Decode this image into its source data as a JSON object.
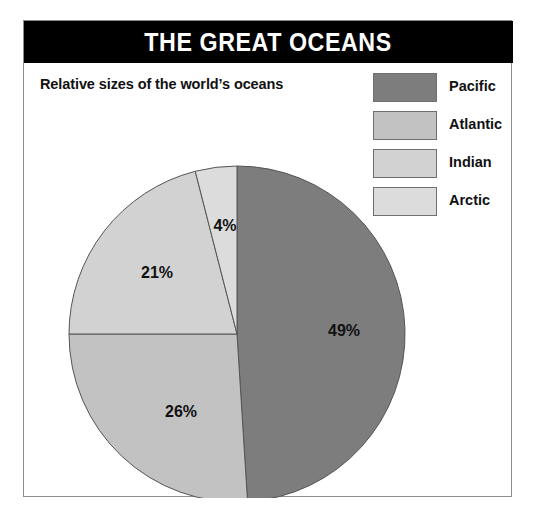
{
  "panel": {
    "title": "THE GREAT OCEANS",
    "subtitle": "Relative sizes of the world’s oceans",
    "border_color": "#8d8d8d",
    "title_bar_color": "#000000",
    "title_text_color": "#ffffff",
    "background_color": "#ffffff"
  },
  "legend": {
    "position": "top-right",
    "items": [
      {
        "label": "Pacific",
        "color": "#7d7d7d"
      },
      {
        "label": "Atlantic",
        "color": "#c2c2c2"
      },
      {
        "label": "Indian",
        "color": "#d2d2d2"
      },
      {
        "label": "Arctic",
        "color": "#dcdcdc"
      }
    ]
  },
  "chart_data": {
    "type": "pie",
    "title": "THE GREAT OCEANS",
    "subtitle": "Relative sizes of the world’s oceans",
    "xlabel": "",
    "ylabel": "",
    "unit": "percent",
    "start_angle_deg": 0,
    "direction": "clockwise",
    "grid": false,
    "legend_position": "top-right",
    "categories": [
      "Pacific",
      "Atlantic",
      "Indian",
      "Arctic"
    ],
    "values": [
      49,
      26,
      21,
      4
    ],
    "labels": [
      "49%",
      "26%",
      "21%",
      "4%"
    ],
    "colors": [
      "#7d7d7d",
      "#c2c2c2",
      "#d2d2d2",
      "#dcdcdc"
    ],
    "slices": [
      {
        "name": "Pacific",
        "value": 49,
        "label": "49%",
        "color": "#7d7d7d",
        "start_deg": 0,
        "end_deg": 176.4,
        "label_x": 320,
        "label_y": 315
      },
      {
        "name": "Atlantic",
        "value": 26,
        "label": "26%",
        "color": "#c2c2c2",
        "start_deg": 176.4,
        "end_deg": 270.0,
        "label_x": 157,
        "label_y": 396
      },
      {
        "name": "Indian",
        "value": 21,
        "label": "21%",
        "color": "#d2d2d2",
        "start_deg": 270.0,
        "end_deg": 345.6,
        "label_x": 133,
        "label_y": 257
      },
      {
        "name": "Arctic",
        "value": 4,
        "label": "4%",
        "color": "#dcdcdc",
        "start_deg": 345.6,
        "end_deg": 360.0,
        "label_x": 201,
        "label_y": 210
      }
    ],
    "geometry": {
      "center_x": 213,
      "center_y": 313,
      "radius": 168
    },
    "stroke_color": "#555555"
  }
}
